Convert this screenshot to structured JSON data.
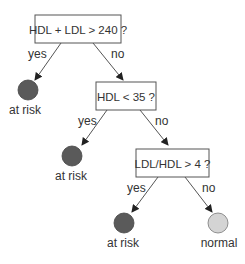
{
  "diagram": {
    "type": "decision-tree",
    "nodes": [
      {
        "id": "q1",
        "kind": "question",
        "label": "HDL + LDL > 240 ?"
      },
      {
        "id": "leaf1",
        "kind": "leaf",
        "label": "at risk",
        "color": "#5a5a5a"
      },
      {
        "id": "q2",
        "kind": "question",
        "label": "HDL < 35 ?"
      },
      {
        "id": "leaf2",
        "kind": "leaf",
        "label": "at risk",
        "color": "#5a5a5a"
      },
      {
        "id": "q3",
        "kind": "question",
        "label": "LDL/HDL > 4 ?"
      },
      {
        "id": "leaf3",
        "kind": "leaf",
        "label": "at risk",
        "color": "#5a5a5a"
      },
      {
        "id": "leaf4",
        "kind": "leaf",
        "label": "normal",
        "color": "#d4d4d4"
      }
    ],
    "edges": [
      {
        "from": "q1",
        "to": "leaf1",
        "label": "yes"
      },
      {
        "from": "q1",
        "to": "q2",
        "label": "no"
      },
      {
        "from": "q2",
        "to": "leaf2",
        "label": "yes"
      },
      {
        "from": "q2",
        "to": "q3",
        "label": "no"
      },
      {
        "from": "q3",
        "to": "leaf3",
        "label": "yes"
      },
      {
        "from": "q3",
        "to": "leaf4",
        "label": "no"
      }
    ]
  }
}
